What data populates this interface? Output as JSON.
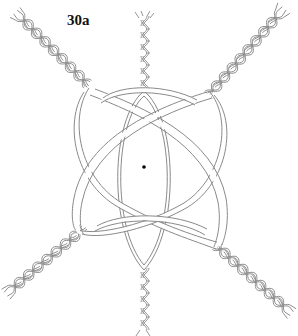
{
  "figure": {
    "label": "30a",
    "center_dot": {
      "x": 144,
      "y": 167
    },
    "colors": {
      "background": "#ffffff",
      "line": "#8a8a8a",
      "label": "#111111",
      "dot": "#000000"
    },
    "elements": [
      {
        "name": "braid-top-left",
        "type": "plait",
        "from": [
          18,
          12
        ],
        "to": [
          92,
          92
        ]
      },
      {
        "name": "braid-top-right",
        "type": "plait",
        "from": [
          282,
          12
        ],
        "to": [
          210,
          95
        ]
      },
      {
        "name": "braid-bottom-left",
        "type": "plait",
        "from": [
          8,
          292
        ],
        "to": [
          80,
          232
        ]
      },
      {
        "name": "braid-bottom-right",
        "type": "plait",
        "from": [
          288,
          312
        ],
        "to": [
          215,
          245
        ]
      },
      {
        "name": "twist-top",
        "type": "twisted-cord",
        "from": [
          144,
          14
        ],
        "to": [
          144,
          92
        ]
      },
      {
        "name": "twist-bottom",
        "type": "twisted-cord",
        "from": [
          144,
          268
        ],
        "to": [
          144,
          336
        ]
      }
    ]
  }
}
